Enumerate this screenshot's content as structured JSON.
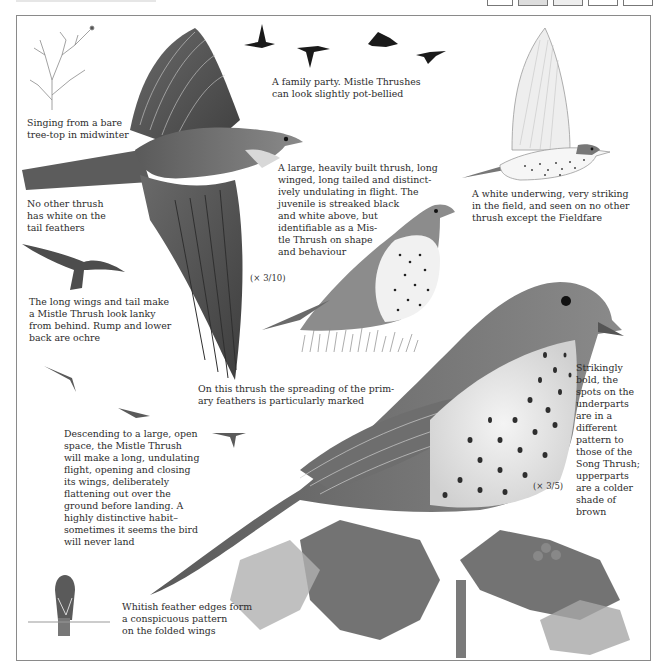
{
  "page": {
    "subject": "Mistle Thrush",
    "header_boxes": 5
  },
  "captions": {
    "tree_top": "Singing from a bare tree-top in midwinter",
    "tree_top_l1": "Singing from a bare",
    "tree_top_l2": "tree-top in midwinter",
    "family_l1": "A family party. Mistle Thrushes",
    "family_l2": "can look slightly pot-bellied",
    "underwing_l1": "A white underwing, very striking",
    "underwing_l2": "in the field, and seen on no other",
    "underwing_l3": "thrush except the Fieldfare",
    "tail_l1": "No other thrush",
    "tail_l2": "has white on the",
    "tail_l3": "tail feathers",
    "juvenile_l1": "A large, heavily built thrush, long",
    "juvenile_l2": "winged, long tailed and distinct-",
    "juvenile_l3": "ively undulating in flight. The",
    "juvenile_l4": "juvenile is streaked black",
    "juvenile_l5": "and white above, but",
    "juvenile_l6": "identifiable as a Mis-",
    "juvenile_l7": "tle Thrush on shape",
    "juvenile_l8": "and behaviour",
    "lanky_l1": "The long wings and tail make",
    "lanky_l2": "a Mistle Thrush look lanky",
    "lanky_l3": "from behind. Rump and lower",
    "lanky_l4": "back are ochre",
    "primaries_l1": "On this thrush the spreading of the prim-",
    "primaries_l2": "ary feathers is particularly marked",
    "descending_l1": "Descending to a large, open",
    "descending_l2": "space, the Mistle Thrush",
    "descending_l3": "will make a long, undulating",
    "descending_l4": "flight, opening and closing",
    "descending_l5": "its wings, deliberately",
    "descending_l6": "flattening out over the",
    "descending_l7": "ground before landing. A",
    "descending_l8": "highly distinctive habit–",
    "descending_l9": "sometimes it seems the bird",
    "descending_l10": "will never land",
    "spots_l1": "Strikingly",
    "spots_l2": "bold, the",
    "spots_l3": "spots on the",
    "spots_l4": "underparts",
    "spots_l5": "are in a",
    "spots_l6": "different",
    "spots_l7": "pattern to",
    "spots_l8": "those of the",
    "spots_l9": "Song Thrush;",
    "spots_l10": "upperparts",
    "spots_l11": "are a colder",
    "spots_l12": "shade of",
    "spots_l13": "brown",
    "wings_l1": "Whitish feather edges form",
    "wings_l2": "a conspicuous pattern",
    "wings_l3": "on the folded wings"
  },
  "scales": {
    "flight_bird": "(× 3/10)",
    "perched_bird": "(× 3/5)"
  },
  "colors": {
    "ink": "#2c2c2c",
    "frame": "#8a8a8a",
    "plumage_dark": "#4a4a4a",
    "plumage_mid": "#7a7a7a",
    "plumage_light": "#b5b5b5",
    "holly": "#5a5a5a"
  }
}
